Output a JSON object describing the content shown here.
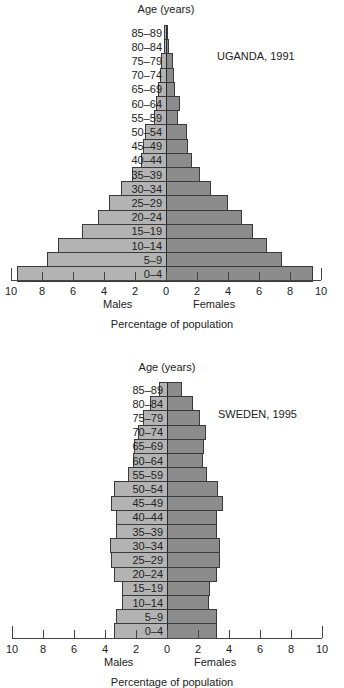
{
  "chart_data": [
    {
      "type": "bar",
      "subtype": "population-pyramid",
      "title": "UGANDA, 1991",
      "ylabel": "Age (years)",
      "xlabel": "Percentage of population",
      "left_label": "Males",
      "right_label": "Females",
      "xlim": [
        -10,
        10
      ],
      "xticks": [
        10,
        8,
        6,
        4,
        2,
        0,
        2,
        4,
        6,
        8,
        10
      ],
      "categories": [
        "85–89",
        "80–84",
        "75–79",
        "70–74",
        "65–69",
        "60–64",
        "55–59",
        "50–54",
        "45–49",
        "40–44",
        "35–39",
        "30–34",
        "25–29",
        "20–24",
        "15–19",
        "10–14",
        "5–9",
        "0–4"
      ],
      "series": [
        {
          "name": "Males",
          "color": "#b3b3b3",
          "values": [
            0.1,
            0.15,
            0.3,
            0.4,
            0.5,
            0.65,
            0.8,
            1.35,
            1.5,
            1.6,
            2.2,
            2.9,
            3.7,
            4.4,
            5.4,
            7.0,
            7.7,
            9.6
          ]
        },
        {
          "name": "Females",
          "color": "#8c8c8c",
          "values": [
            0.1,
            0.2,
            0.45,
            0.5,
            0.6,
            0.9,
            0.8,
            1.35,
            1.45,
            1.7,
            2.2,
            2.9,
            4.0,
            4.9,
            5.6,
            6.5,
            7.5,
            9.5
          ]
        }
      ],
      "grid": false
    },
    {
      "type": "bar",
      "subtype": "population-pyramid",
      "title": "SWEDEN, 1995",
      "ylabel": "Age (years)",
      "xlabel": "Percentage of population",
      "left_label": "Males",
      "right_label": "Females",
      "xlim": [
        -10,
        10
      ],
      "xticks": [
        10,
        8,
        6,
        4,
        2,
        0,
        2,
        4,
        6,
        8,
        10
      ],
      "categories": [
        "85–89",
        "80–84",
        "75–79",
        "70–74",
        "65–69",
        "60–64",
        "55–59",
        "50–54",
        "45–49",
        "40–44",
        "35–39",
        "30–34",
        "25–29",
        "20–24",
        "15–19",
        "10–14",
        "5–9",
        "0–4"
      ],
      "series": [
        {
          "name": "Males",
          "color": "#b3b3b3",
          "values": [
            0.5,
            1.1,
            1.55,
            1.9,
            2.1,
            2.2,
            2.5,
            3.4,
            3.6,
            3.3,
            3.3,
            3.7,
            3.6,
            3.4,
            2.9,
            2.9,
            3.3,
            3.4
          ]
        },
        {
          "name": "Females",
          "color": "#8c8c8c",
          "values": [
            0.95,
            1.7,
            2.1,
            2.5,
            2.4,
            2.3,
            2.6,
            3.3,
            3.6,
            3.2,
            3.2,
            3.4,
            3.4,
            3.2,
            2.8,
            2.7,
            3.2,
            3.2
          ]
        }
      ],
      "grid": false
    }
  ],
  "layout": {
    "pyramids": [
      {
        "age_title_top": 3,
        "country_top": 50,
        "country_left": 217,
        "bars_top": 25,
        "axis_y": 280,
        "center_x": 166,
        "tick_labels_top": 285,
        "side_labels_top": 298,
        "x_title_top": 318,
        "show_x_title": true
      },
      {
        "age_title_top": 361,
        "country_top": 408,
        "country_left": 218,
        "bars_top": 382,
        "axis_y": 638,
        "center_x": 167,
        "tick_labels_top": 643,
        "side_labels_top": 656,
        "x_title_top": 676,
        "show_x_title": true
      }
    ],
    "row_height": 14.2,
    "px_per_pct": 15.5
  }
}
